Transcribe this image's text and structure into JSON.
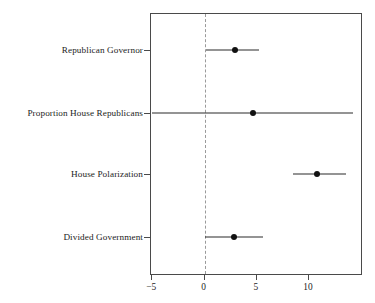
{
  "chart_data": {
    "type": "scatter",
    "title": "",
    "subtitle": "",
    "xlabel": "",
    "ylabel": "",
    "xlim": [
      -5.0,
      15.2
    ],
    "grid": false,
    "legend_position": "none",
    "orientation": "horizontal",
    "reference_line": {
      "value": 0,
      "style": "dashed",
      "color": "#9a9a9a"
    },
    "point_color": "#111111",
    "line_color": "#2b2b2b",
    "xticks": [
      -5,
      0,
      5,
      10
    ],
    "xticklabels": [
      "−5",
      "0",
      "5",
      "10"
    ],
    "categories": [
      "Republican Governor",
      "Proportion House Republicans",
      "House Polarization",
      "Divided Government"
    ],
    "series": [
      {
        "name": "Coefficient estimate with confidence interval",
        "points": [
          {
            "category": "Republican Governor",
            "estimate": 3.0,
            "low": 0.2,
            "high": 5.3
          },
          {
            "category": "Proportion House Republicans",
            "estimate": 4.7,
            "low": -4.9,
            "high": 14.3
          },
          {
            "category": "House Polarization",
            "estimate": 10.9,
            "low": 8.6,
            "high": 13.6
          },
          {
            "category": "Divided Government",
            "estimate": 2.9,
            "low": 0.1,
            "high": 5.7
          }
        ]
      }
    ],
    "annotations": []
  }
}
